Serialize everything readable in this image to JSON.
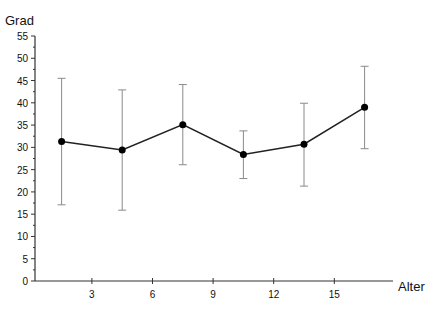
{
  "chart_data": {
    "type": "line",
    "title": "",
    "xlabel": "Alter",
    "ylabel": "Grad",
    "xlim": [
      0,
      18
    ],
    "ylim": [
      0,
      55
    ],
    "grid": false,
    "legend": null,
    "x_ticks": [
      3,
      6,
      9,
      12,
      15
    ],
    "y_ticks": [
      0,
      5,
      10,
      15,
      20,
      25,
      30,
      35,
      40,
      45,
      50,
      55
    ],
    "series": [
      {
        "name": "Mittelwert",
        "x": [
          1.5,
          4.5,
          7.5,
          10.5,
          13.5,
          16.5
        ],
        "values": [
          31.3,
          29.4,
          35.1,
          28.4,
          30.7,
          39.0
        ],
        "error_upper": [
          45.5,
          42.9,
          44.1,
          33.7,
          39.9,
          48.2
        ],
        "error_lower": [
          17.1,
          15.9,
          26.1,
          23.0,
          21.3,
          29.7
        ]
      }
    ]
  },
  "labels": {
    "y_axis_title": "Grad",
    "x_axis_title": "Alter"
  },
  "colors": {
    "line": "#222222",
    "marker": "#000000",
    "error_bar": "#8a8a8a",
    "axis": "#333333"
  }
}
